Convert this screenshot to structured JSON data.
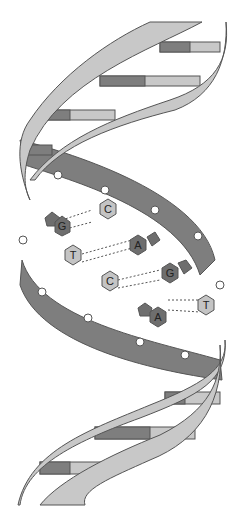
{
  "diagram": {
    "colors": {
      "backbone_light": "#c8c8c8",
      "backbone_dark": "#7e7e7e",
      "base_dark": "#6e6e6e",
      "base_light": "#c4c4c4",
      "outline": "#555555",
      "phosphate": "#ffffff"
    },
    "base_pairs": [
      {
        "left": "G",
        "right": "C"
      },
      {
        "left": "T",
        "right": "A"
      },
      {
        "left": "C",
        "right": "G"
      },
      {
        "left": "A",
        "right": "T"
      }
    ]
  }
}
